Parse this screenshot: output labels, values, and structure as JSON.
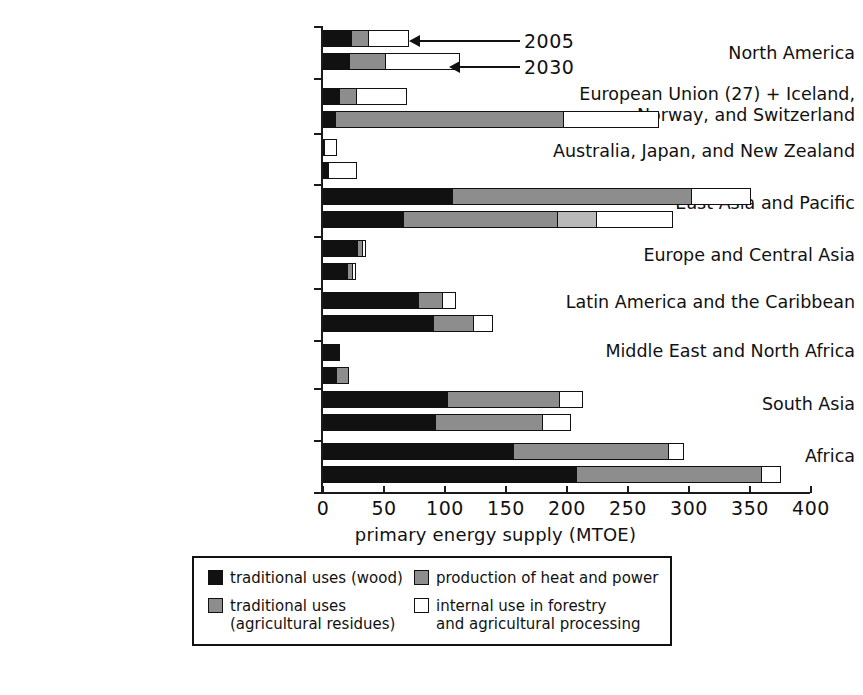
{
  "chart_data": {
    "type": "bar",
    "orientation": "horizontal",
    "title": "",
    "xlabel": "primary energy supply (MTOE)",
    "ylabel": "",
    "xlim": [
      0,
      400
    ],
    "xticks": [
      0,
      50,
      100,
      150,
      200,
      250,
      300,
      350,
      400
    ],
    "xticklabels": [
      "0",
      "50",
      "100",
      "150",
      "200",
      "250",
      "300",
      "350",
      "400"
    ],
    "grid": false,
    "stacked": true,
    "legend_position": "bottom-center",
    "series": [
      {
        "name": "traditional uses (wood)",
        "color": "#111111"
      },
      {
        "name": "traditional uses (agricultural residues)",
        "color": "#8d8d8d"
      },
      {
        "name": "production of heat and power",
        "color": "#b9b9b9"
      },
      {
        "name": "internal use in forestry and agricultural processing",
        "color": "#ffffff"
      }
    ],
    "group_labels": [
      "2005",
      "2030"
    ],
    "categories": [
      "North America",
      "European Union (27) + Iceland,\nNorway, and Switzerland",
      "Australia, Japan, and New Zealand",
      "East Asia and Pacific",
      "Europe and Central Asia",
      "Latin America and the Caribbean",
      "Middle East and North Africa",
      "South Asia",
      "Africa"
    ],
    "rows": [
      {
        "category": "North America",
        "year": "2005",
        "segments": [
          23,
          14,
          0,
          32
        ],
        "total": 69
      },
      {
        "category": "North America",
        "year": "2030",
        "segments": [
          21,
          30,
          0,
          60
        ],
        "total": 111
      },
      {
        "category": "European Union (27) + Iceland,\nNorway, and Switzerland",
        "year": "2005",
        "segments": [
          13,
          14,
          0,
          41
        ],
        "total": 68
      },
      {
        "category": "European Union (27) + Iceland,\nNorway, and Switzerland",
        "year": "2030",
        "segments": [
          10,
          187,
          0,
          78
        ],
        "total": 275
      },
      {
        "category": "Australia, Japan, and New Zealand",
        "year": "2005",
        "segments": [
          1,
          0,
          0,
          9
        ],
        "total": 10
      },
      {
        "category": "Australia, Japan, and New Zealand",
        "year": "2030",
        "segments": [
          4,
          0,
          0,
          23
        ],
        "total": 27
      },
      {
        "category": "East Asia and Pacific",
        "year": "2005",
        "segments": [
          106,
          196,
          0,
          48
        ],
        "total": 350
      },
      {
        "category": "East Asia and Pacific",
        "year": "2030",
        "segments": [
          66,
          126,
          32,
          62
        ],
        "total": 286
      },
      {
        "category": "Europe and Central Asia",
        "year": "2005",
        "segments": [
          28,
          4,
          0,
          2
        ],
        "total": 34
      },
      {
        "category": "Europe and Central Asia",
        "year": "2030",
        "segments": [
          20,
          4,
          0,
          2
        ],
        "total": 26
      },
      {
        "category": "Latin America and the Caribbean",
        "year": "2005",
        "segments": [
          78,
          20,
          0,
          10
        ],
        "total": 108
      },
      {
        "category": "Latin America and the Caribbean",
        "year": "2030",
        "segments": [
          90,
          33,
          0,
          15
        ],
        "total": 138
      },
      {
        "category": "Middle East and North Africa",
        "year": "2005",
        "segments": [
          13,
          0,
          0,
          0
        ],
        "total": 13
      },
      {
        "category": "Middle East and North Africa",
        "year": "2030",
        "segments": [
          11,
          9,
          0,
          0
        ],
        "total": 20
      },
      {
        "category": "South Asia",
        "year": "2005",
        "segments": [
          102,
          92,
          0,
          18
        ],
        "total": 212
      },
      {
        "category": "South Asia",
        "year": "2030",
        "segments": [
          92,
          88,
          0,
          22
        ],
        "total": 202
      },
      {
        "category": "Africa",
        "year": "2005",
        "segments": [
          156,
          127,
          0,
          12
        ],
        "total": 295
      },
      {
        "category": "Africa",
        "year": "2030",
        "segments": [
          208,
          152,
          0,
          15
        ],
        "total": 375
      }
    ],
    "annotations": [
      {
        "label": "2005",
        "points_to": "North America 2005 bar"
      },
      {
        "label": "2030",
        "points_to": "North America 2030 bar"
      }
    ]
  },
  "axis": {
    "xlabel": "primary energy supply (MTOE)",
    "ticklabels": [
      "0",
      "50",
      "100",
      "150",
      "200",
      "250",
      "300",
      "350",
      "400"
    ]
  },
  "categories": [
    {
      "label": "North America"
    },
    {
      "label": "European Union (27) + Iceland,\nNorway, and Switzerland"
    },
    {
      "label": "Australia, Japan, and New Zealand"
    },
    {
      "label": "East Asia and Pacific"
    },
    {
      "label": "Europe and Central Asia"
    },
    {
      "label": "Latin America and the Caribbean"
    },
    {
      "label": "Middle East and North Africa"
    },
    {
      "label": "South Asia"
    },
    {
      "label": "Africa"
    }
  ],
  "annotations": [
    {
      "label": "2005"
    },
    {
      "label": "2030"
    }
  ],
  "legend": {
    "items": [
      {
        "label": "traditional uses (wood)",
        "swatch": "black"
      },
      {
        "label": "production of heat and power",
        "swatch": "dgray"
      },
      {
        "label": "traditional uses\n(agricultural residues)",
        "swatch": "dgray"
      },
      {
        "label": "internal use in forestry\nand agricultural processing",
        "swatch": "white"
      }
    ]
  }
}
